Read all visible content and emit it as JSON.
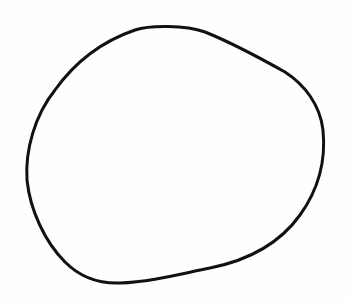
{
  "drawing": {
    "shape": "hand-drawn-circle",
    "stroke_color": "#111111",
    "background_color": "#fefefe",
    "stroke_width": 3
  }
}
